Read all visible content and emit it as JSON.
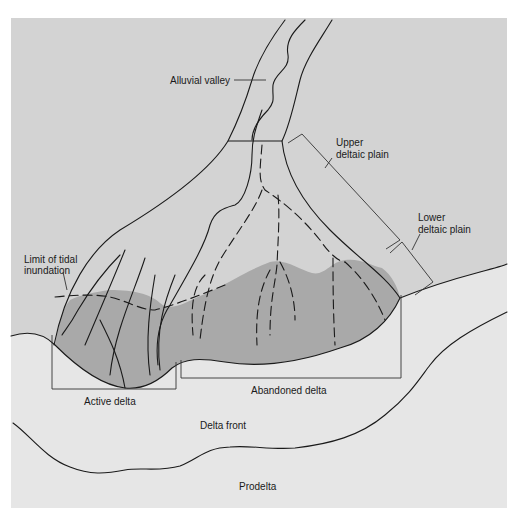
{
  "figure": {
    "type": "schematic map of a river delta",
    "colors": {
      "page_background": "#ffffff",
      "land_plain": "#d3d3d3",
      "lower_delta_fill": "#a9a9a9",
      "sea": "#e6e6e6",
      "line": "#1a1a1a"
    }
  },
  "labels": {
    "alluvial_valley": "Alluvial valley",
    "upper_deltaic_plain_1": "Upper",
    "upper_deltaic_plain_2": "deltaic plain",
    "lower_deltaic_plain_1": "Lower",
    "lower_deltaic_plain_2": "deltaic plain",
    "limit_tidal_1": "Limit of tidal",
    "limit_tidal_2": "inundation",
    "active_delta": "Active delta",
    "abandoned_delta": "Abandoned delta",
    "delta_front": "Delta front",
    "prodelta": "Prodelta"
  }
}
